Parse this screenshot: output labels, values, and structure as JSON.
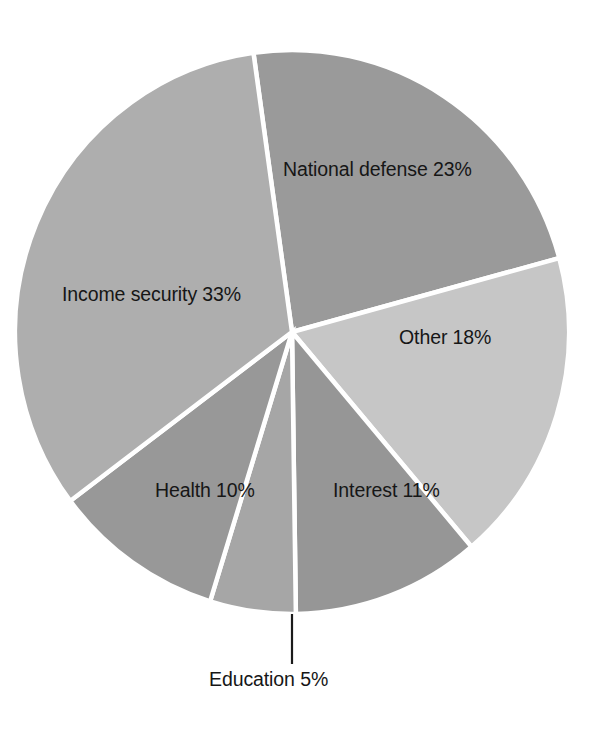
{
  "chart_data": {
    "type": "pie",
    "title": "",
    "subtitle": "",
    "xlabel": "",
    "ylabel": "",
    "legend_position": "none",
    "grid": false,
    "unit": "%",
    "total": 100,
    "start_angle_deg": 352,
    "direction": "clockwise",
    "categories": [
      "National defense",
      "Other",
      "Interest",
      "Education",
      "Health",
      "Income security"
    ],
    "values": [
      23,
      18,
      11,
      5,
      10,
      33
    ],
    "slices": [
      {
        "id": "national-defense",
        "label": "National defense 23%",
        "name": "National defense",
        "value": 23,
        "percent_text": "23%",
        "color": "#9a9a9a",
        "start_deg": 352,
        "sweep_deg": 82.8,
        "label_placement": "inside"
      },
      {
        "id": "other",
        "label": "Other 18%",
        "name": "Other",
        "value": 18,
        "percent_text": "18%",
        "color": "#c6c6c6",
        "start_deg": 74.8,
        "sweep_deg": 64.8,
        "label_placement": "inside"
      },
      {
        "id": "interest",
        "label": "Interest 11%",
        "name": "Interest",
        "value": 11,
        "percent_text": "11%",
        "color": "#969696",
        "start_deg": 139.6,
        "sweep_deg": 39.6,
        "label_placement": "inside"
      },
      {
        "id": "education",
        "label": "Education 5%",
        "name": "Education",
        "value": 5,
        "percent_text": "5%",
        "color": "#a6a6a6",
        "start_deg": 179.2,
        "sweep_deg": 18,
        "label_placement": "callout-below"
      },
      {
        "id": "health",
        "label": "Health 10%",
        "name": "Health",
        "value": 10,
        "percent_text": "10%",
        "color": "#989898",
        "start_deg": 197.2,
        "sweep_deg": 36,
        "label_placement": "inside"
      },
      {
        "id": "income-security",
        "label": "Income security 33%",
        "name": "Income security",
        "value": 33,
        "percent_text": "33%",
        "color": "#aeaeae",
        "start_deg": 233.2,
        "sweep_deg": 118.8,
        "label_placement": "inside"
      }
    ],
    "colors": {
      "background": "#ffffff",
      "slice_divider": "#ffffff",
      "text": "#161616",
      "leader_line": "#1b1b1b"
    },
    "geometry": {
      "center_x": 292,
      "center_y": 332,
      "radius_x": 277,
      "radius_y": 282
    },
    "callout": {
      "label": "Education 5%",
      "line_from_x": 292,
      "line_from_y": 614,
      "line_to_x": 292,
      "line_to_y": 664
    }
  }
}
